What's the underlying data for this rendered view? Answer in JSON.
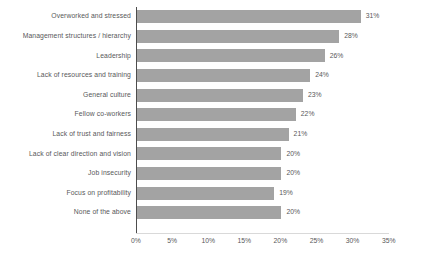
{
  "chart_data": {
    "type": "bar",
    "orientation": "horizontal",
    "title": "",
    "subtitle": "",
    "xlabel": "",
    "ylabel": "",
    "xlim": [
      0,
      35
    ],
    "xticks": [
      "0%",
      "5%",
      "10%",
      "15%",
      "20%",
      "25%",
      "30%",
      "35%"
    ],
    "xtick_values": [
      0,
      5,
      10,
      15,
      20,
      25,
      30,
      35
    ],
    "grid": false,
    "legend": false,
    "legend_position": "none",
    "bar_color": "#a3a3a3",
    "text_color": "#58585a",
    "axis_color": "#4d4d4d",
    "background": "#ffffff",
    "categories": [
      "Overworked and stressed",
      "Management structures / hierarchy",
      "Leadership",
      "Lack of resources and training",
      "General culture",
      "Fellow co-workers",
      "Lack of trust and fairness",
      "Lack of clear direction and vision",
      "Job insecurity",
      "Focus on profitability",
      "None of the above"
    ],
    "values": [
      31,
      28,
      26,
      24,
      23,
      22,
      21,
      20,
      20,
      19,
      20
    ],
    "data_labels": [
      "31%",
      "28%",
      "26%",
      "24%",
      "23%",
      "22%",
      "21%",
      "20%",
      "20%",
      "19%",
      "20%"
    ]
  }
}
